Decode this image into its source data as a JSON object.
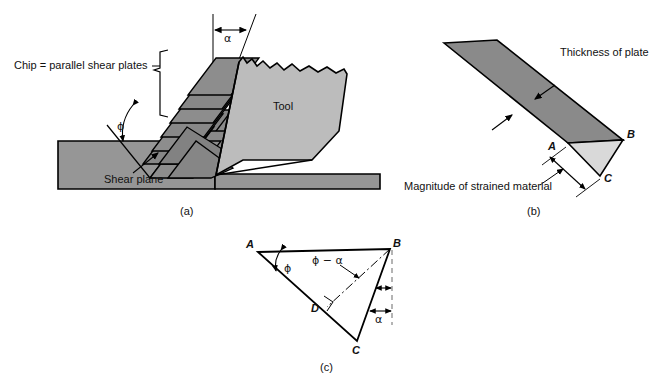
{
  "figure": {
    "colors": {
      "chip_plate_fill": "#8a8a8a",
      "chip_plate_fill_alt": "#7d7d7d",
      "workpiece_fill": "#969696",
      "tool_fill": "#bcbcbc",
      "strained_triangle_fill": "#d9d9d9",
      "outline": "#000000",
      "dashed": "#666666",
      "background": "#ffffff"
    }
  },
  "panel_a": {
    "caption": "(a)",
    "labels": {
      "chip": "Chip = parallel shear plates",
      "shear_plane": "Shear plane",
      "tool": "Tool",
      "angle_alpha": "α",
      "angle_phi": "ϕ"
    },
    "plate_count": 8
  },
  "panel_b": {
    "caption": "(b)",
    "labels": {
      "thickness": "Thickness of plate",
      "magnitude": "Magnitude of strained material",
      "vertex_a": "A",
      "vertex_b": "B",
      "vertex_c": "C"
    }
  },
  "panel_c": {
    "caption": "(c)",
    "labels": {
      "vertex_a": "A",
      "vertex_b": "B",
      "vertex_c": "C",
      "vertex_d": "D",
      "angle_phi": "ϕ",
      "angle_phi_minus_alpha": "ϕ − α",
      "angle_alpha": "α"
    }
  }
}
